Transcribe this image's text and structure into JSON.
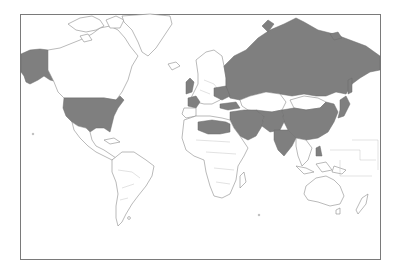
{
  "map": {
    "type": "world-map",
    "projection": "mercator",
    "colors": {
      "highlight": "#7f7f7f",
      "land": "#ffffff",
      "outline": "#8c8c8c",
      "frame": "#7a7a7a",
      "background": "#ffffff"
    },
    "highlighted_regions": [
      "United States",
      "Alaska",
      "United Kingdom",
      "France",
      "Russia",
      "China",
      "Japan",
      "India",
      "Pakistan",
      "Afghanistan",
      "Iran",
      "Iraq",
      "Saudi Arabia",
      "Turkey",
      "Ukraine",
      "Belarus",
      "Libya",
      "Egypt",
      "Algeria",
      "Syria",
      "Philippines"
    ],
    "unhighlighted_notable": [
      "Kazakhstan",
      "Mongolia",
      "Canada",
      "Greenland",
      "South America",
      "Sub-Saharan Africa",
      "Australia"
    ]
  }
}
